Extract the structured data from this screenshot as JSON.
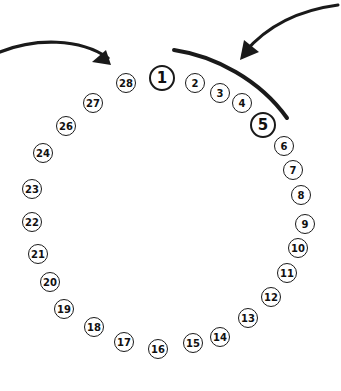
{
  "diagram": {
    "title": "",
    "nodes": [
      {
        "label": "1",
        "x": 162,
        "y": 78,
        "r": 13,
        "big": true
      },
      {
        "label": "2",
        "x": 195,
        "y": 83,
        "r": 10
      },
      {
        "label": "3",
        "x": 220,
        "y": 93,
        "r": 10
      },
      {
        "label": "4",
        "x": 242,
        "y": 103,
        "r": 10
      },
      {
        "label": "5",
        "x": 263,
        "y": 125,
        "r": 13,
        "big": true
      },
      {
        "label": "6",
        "x": 284,
        "y": 146,
        "r": 10
      },
      {
        "label": "7",
        "x": 293,
        "y": 170,
        "r": 10
      },
      {
        "label": "8",
        "x": 301,
        "y": 195,
        "r": 10
      },
      {
        "label": "9",
        "x": 305,
        "y": 224,
        "r": 10
      },
      {
        "label": "10",
        "x": 298,
        "y": 248,
        "r": 10
      },
      {
        "label": "11",
        "x": 287,
        "y": 273,
        "r": 10
      },
      {
        "label": "12",
        "x": 271,
        "y": 297,
        "r": 10
      },
      {
        "label": "13",
        "x": 248,
        "y": 318,
        "r": 10
      },
      {
        "label": "14",
        "x": 220,
        "y": 337,
        "r": 10
      },
      {
        "label": "15",
        "x": 193,
        "y": 343,
        "r": 10
      },
      {
        "label": "16",
        "x": 158,
        "y": 349,
        "r": 10
      },
      {
        "label": "17",
        "x": 124,
        "y": 342,
        "r": 10
      },
      {
        "label": "18",
        "x": 94,
        "y": 327,
        "r": 10
      },
      {
        "label": "19",
        "x": 64,
        "y": 309,
        "r": 10
      },
      {
        "label": "20",
        "x": 50,
        "y": 282,
        "r": 10
      },
      {
        "label": "21",
        "x": 38,
        "y": 254,
        "r": 10
      },
      {
        "label": "22",
        "x": 32,
        "y": 222,
        "r": 10
      },
      {
        "label": "23",
        "x": 32,
        "y": 189,
        "r": 10
      },
      {
        "label": "24",
        "x": 43,
        "y": 153,
        "r": 10
      },
      {
        "label": "26",
        "x": 66,
        "y": 126,
        "r": 10
      },
      {
        "label": "27",
        "x": 93,
        "y": 103,
        "r": 10
      },
      {
        "label": "28",
        "x": 126,
        "y": 83,
        "r": 10
      }
    ],
    "arrows": [
      {
        "name": "left-curved-arrow",
        "description": "curved arrow from left edge pointing to node 28"
      },
      {
        "name": "right-curved-arrow",
        "description": "curved arrow from top right pointing down-left toward arc"
      }
    ],
    "arc": {
      "name": "bracket-arc",
      "description": "thick arc spanning nodes 1 to 5"
    }
  }
}
